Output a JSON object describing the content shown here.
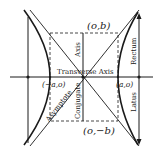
{
  "diagram": {
    "type": "hyperbola",
    "labels": {
      "top_vertex": "(o,b)",
      "bottom_vertex": "(o,−b)",
      "left_vertex": "(−a,o)",
      "right_vertex": "(a,o)",
      "transverse_axis": "Transverse Axis",
      "conjugate_axis_top": "Axis",
      "conjugate_axis_bottom": "Conjugate",
      "asymptote": "Asymptote",
      "latus_rectum_top": "Rectum",
      "latus_rectum_bottom": "Latus"
    },
    "colors": {
      "ink": "#1a1a1a",
      "background": "#ffffff"
    }
  }
}
